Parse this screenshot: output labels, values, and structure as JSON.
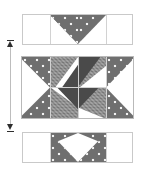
{
  "figure": {
    "background_color": "#ffffff"
  },
  "palette": {
    "dotted_fabric": "#6f6f6f",
    "dot_color": "#f2f2f2",
    "checked_fabric": "#8a8a8a",
    "solid_dark_fabric": "#4a4a4a",
    "background_fabric": "#ffffff",
    "seam_line": "#c9c9c9",
    "arrow_color": "#2e2e2e",
    "arrow_shaft_color": "#bdbdbd"
  },
  "arrow": {
    "name": "assembly-direction-arrow",
    "orientation": "vertical",
    "heads": "double",
    "top_head": "up",
    "bottom_head": "down",
    "label": ""
  },
  "rows": [
    {
      "id": "top-row",
      "name": "top-flying-geese-strip",
      "label": "Top row",
      "units": [
        {
          "name": "corner-square-left",
          "fabric": "background_fabric",
          "shape": "square"
        },
        {
          "name": "flying-geese-left",
          "fabric": "dotted_fabric",
          "shape": "half-square-triangle-down-right"
        },
        {
          "name": "flying-geese-right",
          "fabric": "dotted_fabric",
          "shape": "half-square-triangle-down-left"
        },
        {
          "name": "corner-square-right",
          "fabric": "background_fabric",
          "shape": "square"
        }
      ],
      "motif": "V-shaped star point pair"
    },
    {
      "id": "center-row",
      "name": "center-pieced-block",
      "label": "Center block",
      "units": [
        {
          "name": "left-star-point",
          "fabric": "dotted_fabric",
          "shape": "square-with-white-triangle-right"
        },
        {
          "name": "inner-top-left",
          "fabric": "checked_fabric",
          "shape": "half-square-triangle"
        },
        {
          "name": "inner-top-right",
          "fabric": "checked_fabric",
          "shape": "half-square-triangle"
        },
        {
          "name": "pinwheel-center",
          "fabric": "solid_dark_fabric",
          "shape": "four-blade-pinwheel"
        },
        {
          "name": "inner-bottom-left",
          "fabric": "checked_fabric",
          "shape": "half-square-triangle"
        },
        {
          "name": "inner-bottom-right",
          "fabric": "checked_fabric",
          "shape": "half-square-triangle"
        },
        {
          "name": "right-star-point",
          "fabric": "dotted_fabric",
          "shape": "square-with-white-triangle-left"
        }
      ],
      "motif": "Pinwheel surrounded by star points"
    },
    {
      "id": "bottom-row",
      "name": "bottom-flying-geese-strip",
      "label": "Bottom row",
      "units": [
        {
          "name": "corner-square-left",
          "fabric": "background_fabric",
          "shape": "square"
        },
        {
          "name": "flying-geese-left",
          "fabric": "dotted_fabric",
          "shape": "half-square-triangle-up-right"
        },
        {
          "name": "flying-geese-right",
          "fabric": "dotted_fabric",
          "shape": "half-square-triangle-up-left"
        },
        {
          "name": "corner-square-right",
          "fabric": "background_fabric",
          "shape": "square"
        }
      ],
      "motif": "Lambda-shaped star point pair"
    }
  ]
}
